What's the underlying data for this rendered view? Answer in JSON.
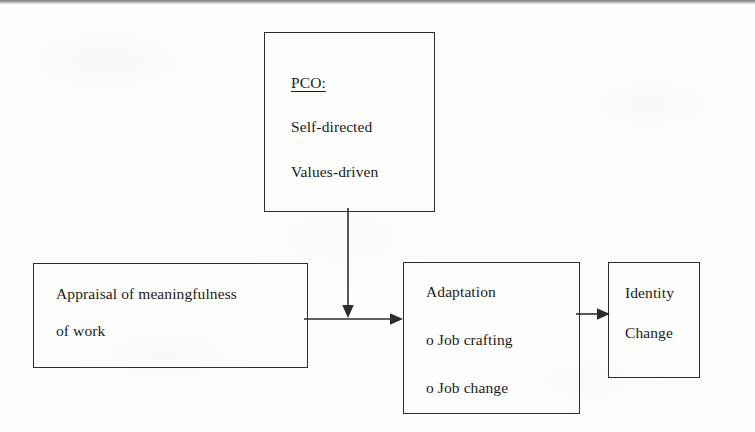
{
  "diagram": {
    "type": "flow-diagram",
    "background_color": "#fdfdfc",
    "line_color": "#2c2c2c",
    "text_color": "#1b1b1b",
    "nodes": [
      {
        "id": "pco",
        "name": "pco-box",
        "heading": "PCO:",
        "heading_underlined": true,
        "lines": [
          "Self-directed",
          "Values-driven"
        ],
        "x": 264,
        "y": 32,
        "width": 171,
        "height": 180
      },
      {
        "id": "appraisal",
        "name": "appraisal-box",
        "lines": [
          "Appraisal of meaningfulness",
          "of work"
        ],
        "x": 33,
        "y": 263,
        "width": 275,
        "height": 105
      },
      {
        "id": "adaptation",
        "name": "adaptation-box",
        "lines": [
          "Adaptation",
          "o Job crafting",
          "o Job change"
        ],
        "x": 403,
        "y": 262,
        "width": 177,
        "height": 152
      },
      {
        "id": "identity",
        "name": "identity-box",
        "lines": [
          "Identity",
          "Change"
        ],
        "x": 608,
        "y": 262,
        "width": 92,
        "height": 116
      }
    ],
    "connectors": [
      {
        "id": "pco-to-flow",
        "name": "arrow-pco-to-flow",
        "from": "pco",
        "to": "appraisal-adaptation-link",
        "orientation": "vertical",
        "arrowhead": "down"
      },
      {
        "id": "appraisal-to-adaptation",
        "name": "arrow-appraisal-to-adaptation",
        "from": "appraisal",
        "to": "adaptation",
        "orientation": "horizontal",
        "arrowhead": "right"
      },
      {
        "id": "adaptation-to-identity",
        "name": "arrow-adaptation-to-identity",
        "from": "adaptation",
        "to": "identity",
        "orientation": "horizontal",
        "arrowhead": "right"
      }
    ]
  }
}
